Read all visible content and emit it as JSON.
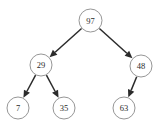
{
  "diagram": {
    "kind": "binary-tree-diagram",
    "width": 164,
    "height": 126,
    "background_color": "#ffffff",
    "node_fill_color": "#ffffff",
    "node_stroke_color": "#8a8a8a",
    "label_color": "#2b2b2b",
    "edge_color": "#2b2b2b",
    "nodes": [
      {
        "id": "n97",
        "label": "97",
        "cx": 90.5,
        "cy": 20.5,
        "r": 11.5,
        "level": 0,
        "role": "root"
      },
      {
        "id": "n29",
        "label": "29",
        "cx": 41.0,
        "cy": 65.0,
        "r": 11.0,
        "level": 1,
        "role": "internal"
      },
      {
        "id": "n48",
        "label": "48",
        "cx": 141.0,
        "cy": 66.0,
        "r": 11.0,
        "level": 1,
        "role": "internal"
      },
      {
        "id": "n7",
        "label": "7",
        "cx": 18.0,
        "cy": 108.0,
        "r": 11.0,
        "level": 2,
        "role": "leaf"
      },
      {
        "id": "n35",
        "label": "35",
        "cx": 64.0,
        "cy": 108.0,
        "r": 11.0,
        "level": 2,
        "role": "leaf"
      },
      {
        "id": "n63",
        "label": "63",
        "cx": 124.0,
        "cy": 108.0,
        "r": 11.0,
        "level": 2,
        "role": "leaf"
      }
    ],
    "edges": [
      {
        "id": "e-97-29",
        "from": "n97",
        "to": "n29",
        "direction": "left",
        "arrow": true
      },
      {
        "id": "e-97-48",
        "from": "n97",
        "to": "n48",
        "direction": "right",
        "arrow": true
      },
      {
        "id": "e-29-7",
        "from": "n29",
        "to": "n7",
        "direction": "left",
        "arrow": true
      },
      {
        "id": "e-29-35",
        "from": "n29",
        "to": "n35",
        "direction": "right",
        "arrow": true
      },
      {
        "id": "e-48-63",
        "from": "n48",
        "to": "n63",
        "direction": "left",
        "arrow": true
      }
    ]
  }
}
